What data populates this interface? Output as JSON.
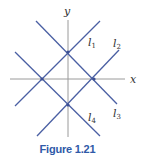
{
  "figure": {
    "caption": "Figure 1.21",
    "axes": {
      "x_label": "x",
      "y_label": "y"
    },
    "lines": [
      {
        "id": "l1",
        "label": "l",
        "sub": "1"
      },
      {
        "id": "l2",
        "label": "l",
        "sub": "2"
      },
      {
        "id": "l3",
        "label": "l",
        "sub": "3"
      },
      {
        "id": "l4",
        "label": "l",
        "sub": "4"
      }
    ],
    "colors": {
      "line": "#4a5fa3",
      "axis": "#9a9a9a",
      "caption": "#2f5aa8"
    }
  }
}
